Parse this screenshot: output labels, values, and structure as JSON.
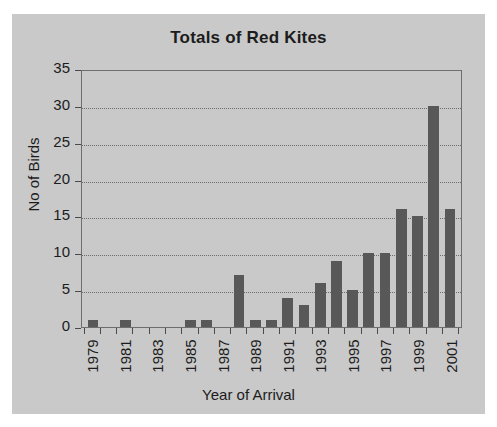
{
  "chart_data": {
    "type": "bar",
    "title": "Totals of Red Kites",
    "xlabel": "Year of Arrival",
    "ylabel": "No of Birds",
    "categories": [
      "1979",
      "1980",
      "1981",
      "1982",
      "1983",
      "1984",
      "1985",
      "1986",
      "1987",
      "1988",
      "1989",
      "1990",
      "1991",
      "1992",
      "1993",
      "1994",
      "1995",
      "1996",
      "1997",
      "1998",
      "1999",
      "2000",
      "2001"
    ],
    "values": [
      1,
      0,
      1,
      0,
      0,
      0,
      1,
      1,
      0,
      7,
      1,
      1,
      4,
      3,
      6,
      9,
      5,
      10,
      10,
      16,
      15,
      30,
      16
    ],
    "visible_tick_labels": [
      "1979",
      "1981",
      "1983",
      "1985",
      "1987",
      "1989",
      "1991",
      "1993",
      "1995",
      "1997",
      "1999",
      "2001"
    ],
    "ylim": [
      0,
      35
    ],
    "yticks": [
      0,
      5,
      10,
      15,
      20,
      25,
      30,
      35
    ],
    "grid": true,
    "legend": false,
    "colors": {
      "bar": "#585858",
      "panel_background": "#c9c9c9",
      "page_background": "#ffffff",
      "axis": "#6e6e6e",
      "gridline": "#6b6b6b",
      "text": "#1c1c1c"
    }
  }
}
